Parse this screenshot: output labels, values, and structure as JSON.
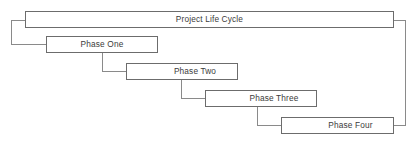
{
  "diagram": {
    "type": "cascade-staircase",
    "title": "Project Life Cycle",
    "root": {
      "label": "Project Life Cycle",
      "x": 25,
      "y": 11,
      "width": 369,
      "height": 17,
      "text_align": "center"
    },
    "phases": [
      {
        "label": "Phase One",
        "x": 46,
        "y": 36,
        "width": 112,
        "height": 17,
        "text_align": "center"
      },
      {
        "label": "Phase Two",
        "x": 126,
        "y": 63,
        "width": 112,
        "height": 17,
        "text_align": "right-ish"
      },
      {
        "label": "Phase Three",
        "x": 205,
        "y": 90,
        "width": 112,
        "height": 17,
        "text_align": "right-ish"
      },
      {
        "label": "Phase Four",
        "x": 281,
        "y": 117,
        "width": 113,
        "height": 17,
        "text_align": "right-ish"
      }
    ],
    "brackets": {
      "left": {
        "x": 11,
        "top_y": 20,
        "bottom_y": 45,
        "from": "Project Life Cycle",
        "to": "Phase One"
      },
      "right": {
        "x": 405,
        "top_y": 20,
        "bottom_y": 126,
        "from": "Project Life Cycle",
        "to": "Phase Four"
      }
    },
    "connectors": [
      {
        "from": "Phase One",
        "to": "Phase Two",
        "drop_x": 102,
        "start_y": 53,
        "end_y": 71
      },
      {
        "from": "Phase Two",
        "to": "Phase Three",
        "drop_x": 181,
        "start_y": 80,
        "end_y": 98
      },
      {
        "from": "Phase Three",
        "to": "Phase Four",
        "drop_x": 257,
        "start_y": 107,
        "end_y": 125
      }
    ],
    "colors": {
      "background": "#ffffff",
      "box_border": "#6c6c6c",
      "box_fill": "#ffffff",
      "connector_line": "#8a8a8a",
      "text": "#3b3b3b"
    }
  }
}
